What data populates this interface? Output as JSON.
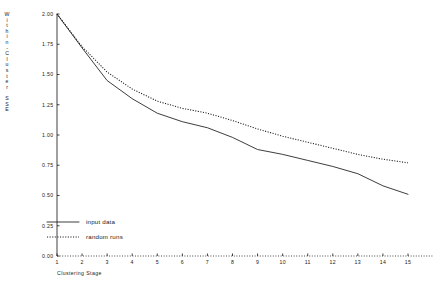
{
  "chart_data": {
    "type": "line",
    "title": "",
    "xlabel": "Clustering Stage",
    "ylabel": "Within-Cluster SSE",
    "ylabel_chars": [
      "W",
      "i",
      "t",
      "h",
      "i",
      "n",
      "-",
      "C",
      "l",
      "u",
      "s",
      "t",
      "e",
      "r",
      " ",
      "S",
      "S",
      "E"
    ],
    "x": [
      1,
      2,
      3,
      4,
      5,
      6,
      7,
      8,
      9,
      10,
      11,
      12,
      13,
      14,
      15
    ],
    "xticklabels": [
      "1",
      "2",
      "3",
      "4",
      "5",
      "6",
      "7",
      "8",
      "9",
      "10",
      "11",
      "12",
      "13",
      "14",
      "15"
    ],
    "yticks": [
      0.0,
      0.25,
      0.5,
      0.75,
      1.0,
      1.25,
      1.5,
      1.75,
      2.0
    ],
    "yticklabels": [
      "0.00",
      "0.25",
      "0.50",
      "0.75",
      "1.00",
      "1.25",
      "1.50",
      "1.75",
      "2.00"
    ],
    "xlim": [
      1,
      15
    ],
    "ylim": [
      0.0,
      2.0
    ],
    "grid": false,
    "legend_position": "lower-left",
    "series": [
      {
        "name": "input data",
        "style": "solid",
        "color": "#1a1a1a",
        "values": [
          2.0,
          1.72,
          1.45,
          1.3,
          1.18,
          1.11,
          1.06,
          0.98,
          0.88,
          0.84,
          0.79,
          0.74,
          0.68,
          0.58,
          0.51
        ]
      },
      {
        "name": "random runs",
        "style": "dotted",
        "color": "#1a1a1a",
        "values": [
          2.0,
          1.73,
          1.52,
          1.38,
          1.28,
          1.22,
          1.18,
          1.12,
          1.05,
          0.99,
          0.94,
          0.89,
          0.84,
          0.8,
          0.77
        ]
      }
    ],
    "legend": [
      {
        "label": "input data",
        "style": "solid"
      },
      {
        "label": "random runs",
        "style": "dotted"
      }
    ]
  },
  "geometry": {
    "x_left_px": 57,
    "x_right_px": 408,
    "y_top_px": 14,
    "y_bottom_px": 256
  }
}
